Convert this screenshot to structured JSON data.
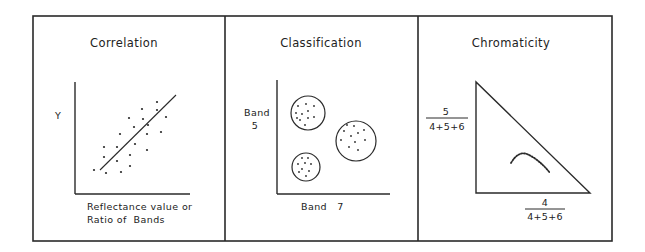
{
  "colors": {
    "ink": "#2a2a2a",
    "background": "#ffffff"
  },
  "panels": [
    {
      "id": "correlation",
      "title": "Correlation",
      "y_label": "Y",
      "x_label_line1": "Reflectance value or",
      "x_label_line2": "Ratio of  Bands"
    },
    {
      "id": "classification",
      "title": "Classification",
      "y_label_line1": "Band",
      "y_label_line2": "5",
      "x_label": "Band   7"
    },
    {
      "id": "chromaticity",
      "title": "Chromaticity",
      "y_fraction": {
        "numerator": "5",
        "denominator": "4+5+6"
      },
      "x_fraction": {
        "numerator": "4",
        "denominator": "4+5+6"
      }
    }
  ],
  "correlation_points": [
    [
      94,
      170
    ],
    [
      106,
      173
    ],
    [
      121,
      172
    ],
    [
      130,
      166
    ],
    [
      117,
      161
    ],
    [
      104,
      157
    ],
    [
      130,
      155
    ],
    [
      104,
      147
    ],
    [
      117,
      147
    ],
    [
      135,
      144
    ],
    [
      147,
      150
    ],
    [
      120,
      134
    ],
    [
      134,
      127
    ],
    [
      129,
      118
    ],
    [
      142,
      109
    ],
    [
      143,
      119
    ],
    [
      148,
      125
    ],
    [
      147,
      134
    ],
    [
      161,
      132
    ],
    [
      166,
      117
    ],
    [
      157,
      110
    ],
    [
      157,
      102
    ]
  ],
  "correlation_line": {
    "x1": 100,
    "y1": 170,
    "x2": 176,
    "y2": 95
  },
  "clusters": [
    {
      "cx": 308,
      "cy": 113,
      "r": 17,
      "points": [
        [
          298,
          106
        ],
        [
          306,
          104
        ],
        [
          314,
          106
        ],
        [
          296,
          113
        ],
        [
          302,
          114
        ],
        [
          308,
          111
        ],
        [
          308,
          118
        ],
        [
          314,
          117
        ],
        [
          300,
          120
        ],
        [
          305,
          125
        ],
        [
          297,
          118
        ]
      ]
    },
    {
      "cx": 356,
      "cy": 141,
      "r": 20,
      "points": [
        [
          347,
          125
        ],
        [
          354,
          126
        ],
        [
          344,
          131
        ],
        [
          358,
          133
        ],
        [
          364,
          130
        ],
        [
          351,
          136
        ],
        [
          341,
          140
        ],
        [
          355,
          142
        ],
        [
          365,
          140
        ],
        [
          349,
          147
        ],
        [
          358,
          150
        ]
      ]
    },
    {
      "cx": 306,
      "cy": 167,
      "r": 14,
      "points": [
        [
          302,
          158
        ],
        [
          308,
          158
        ],
        [
          298,
          164
        ],
        [
          305,
          163
        ],
        [
          311,
          164
        ],
        [
          302,
          169
        ],
        [
          309,
          171
        ],
        [
          299,
          172
        ],
        [
          306,
          176
        ]
      ]
    }
  ]
}
